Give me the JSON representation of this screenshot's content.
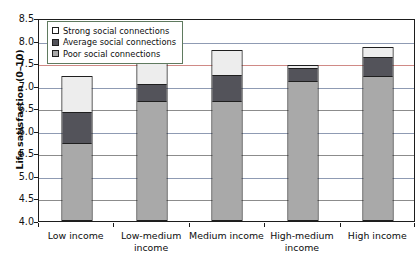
{
  "chart_data": {
    "type": "bar",
    "subtype": "stacked-bar",
    "title": "",
    "xlabel": "",
    "ylabel": "Life satisfaction (0–10)",
    "ylim": [
      4.0,
      8.5
    ],
    "yticks": [
      "8.5",
      "8.0",
      "7.5",
      "7.0",
      "6.5",
      "6.0",
      "5.5",
      "5.0",
      "4.5",
      "4.0"
    ],
    "ytick_values": [
      8.5,
      8.0,
      7.5,
      7.0,
      6.5,
      6.0,
      5.5,
      5.0,
      4.5,
      4.0
    ],
    "grid": true,
    "legend_position": "top-left",
    "categories": [
      "Low income",
      "Low-medium income",
      "Medium income",
      "High-medium income",
      "High income"
    ],
    "series": [
      {
        "name": "Poor social connections",
        "color": "#a9a9a9",
        "values": [
          5.7,
          6.65,
          6.65,
          7.1,
          7.2
        ]
      },
      {
        "name": "Average social connections",
        "color": "#53535a",
        "values": [
          6.42,
          7.05,
          7.25,
          7.42,
          7.65
        ]
      },
      {
        "name": "Strong social connections",
        "color": "#ededed",
        "values": [
          7.22,
          7.58,
          7.8,
          7.45,
          7.85
        ]
      }
    ]
  },
  "legend": {
    "items": [
      {
        "label": "Strong social connections",
        "swatch": "strong"
      },
      {
        "label": "Average social connections",
        "swatch": "average"
      },
      {
        "label": "Poor social connections",
        "swatch": "poor"
      }
    ]
  }
}
